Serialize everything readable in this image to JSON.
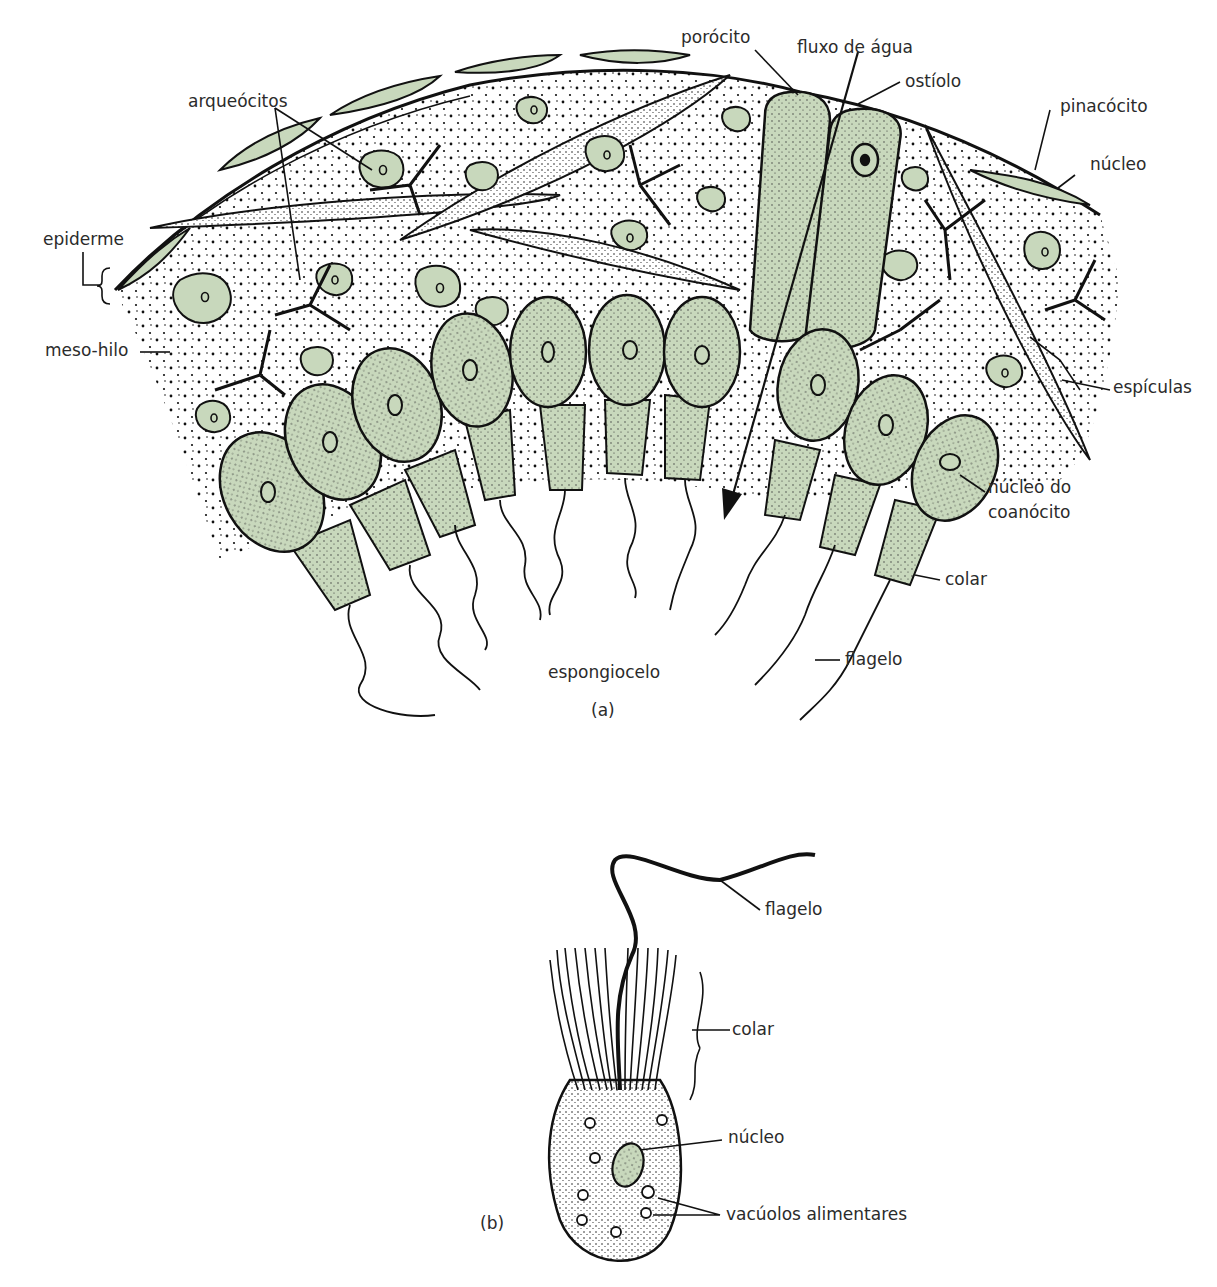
{
  "figure_a": {
    "caption": "(a)",
    "labels": {
      "porocyte": "porócito",
      "water_flow": "fluxo de água",
      "ostium": "ostíolo",
      "archaeocytes": "arqueócitos",
      "pinacocyte": "pinacócito",
      "nucleus": "núcleo",
      "epidermis": "epiderme",
      "mesohyl": "meso-hilo",
      "spicules": "espículas",
      "choanocyte_nucleus_line1": "núcleo do",
      "choanocyte_nucleus_line2": "coanócito",
      "collar": "colar",
      "flagellum": "flagelo",
      "spongocoel": "espongiocelo"
    }
  },
  "figure_b": {
    "caption": "(b)",
    "labels": {
      "flagellum": "flagelo",
      "collar": "colar",
      "nucleus": "núcleo",
      "food_vacuoles": "vacúolos alimentares"
    }
  },
  "colors": {
    "cell_fill": "#c8d8bc",
    "outline": "#111111",
    "background": "#ffffff"
  }
}
